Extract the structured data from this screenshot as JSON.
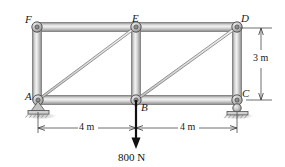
{
  "figure": {
    "type": "truss-free-body-diagram",
    "nodes": [
      {
        "id": "F",
        "label": "F",
        "x": 37,
        "y": 27,
        "label_dx": -12,
        "label_dy": -13
      },
      {
        "id": "E",
        "label": "E",
        "x": 136,
        "y": 27,
        "label_dx": -4,
        "label_dy": -14
      },
      {
        "id": "D",
        "label": "D",
        "x": 237,
        "y": 27,
        "label_dx": 4,
        "label_dy": -14
      },
      {
        "id": "A",
        "label": "A",
        "x": 38,
        "y": 100,
        "label_dx": -13,
        "label_dy": -9
      },
      {
        "id": "B",
        "label": "B",
        "x": 136,
        "y": 100,
        "label_dx": 5,
        "label_dy": 2
      },
      {
        "id": "C",
        "label": "C",
        "x": 237,
        "y": 100,
        "label_dx": 5,
        "label_dy": -12
      }
    ],
    "members": [
      {
        "from": "F",
        "to": "E",
        "kind": "chord-top"
      },
      {
        "from": "E",
        "to": "D",
        "kind": "chord-top"
      },
      {
        "from": "A",
        "to": "B",
        "kind": "chord-bottom"
      },
      {
        "from": "B",
        "to": "C",
        "kind": "chord-bottom"
      },
      {
        "from": "F",
        "to": "A",
        "kind": "vertical"
      },
      {
        "from": "E",
        "to": "B",
        "kind": "vertical"
      },
      {
        "from": "D",
        "to": "C",
        "kind": "vertical"
      },
      {
        "from": "A",
        "to": "E",
        "kind": "diagonal"
      },
      {
        "from": "B",
        "to": "D",
        "kind": "diagonal"
      }
    ],
    "supports": [
      {
        "at": "A",
        "type": "pin",
        "name": "pin-support"
      },
      {
        "at": "C",
        "type": "roller",
        "name": "roller-support"
      }
    ],
    "load": {
      "at": "B",
      "label": "800 N",
      "direction": "down",
      "tip_y": 148,
      "text_x": 136,
      "text_y": 158
    },
    "dimensions": [
      {
        "name": "span-left",
        "label": "4 m",
        "orientation": "horizontal",
        "from_x": 38,
        "to_x": 136,
        "line_y": 128,
        "text_x": 87,
        "text_y": 125
      },
      {
        "name": "span-right",
        "label": "4 m",
        "orientation": "horizontal",
        "from_x": 136,
        "to_x": 237,
        "line_y": 128,
        "text_x": 187,
        "text_y": 125
      },
      {
        "name": "height",
        "label": "3 m",
        "orientation": "vertical",
        "from_y": 28,
        "to_y": 100,
        "line_x": 261,
        "text_x": 262,
        "text_y": 58
      }
    ],
    "colors": {
      "member_light": "#e9e9e9",
      "member_mid": "#c2c2c2",
      "member_edge": "#6f6f6f",
      "pin_fill": "#bdbdbd",
      "pin_edge": "#4d4d4d",
      "ground": "#9a9a9a",
      "text": "#1a1a1a",
      "arrow": "#111111",
      "dim_line": "#4a4a4a",
      "background": "#ffffff"
    }
  }
}
